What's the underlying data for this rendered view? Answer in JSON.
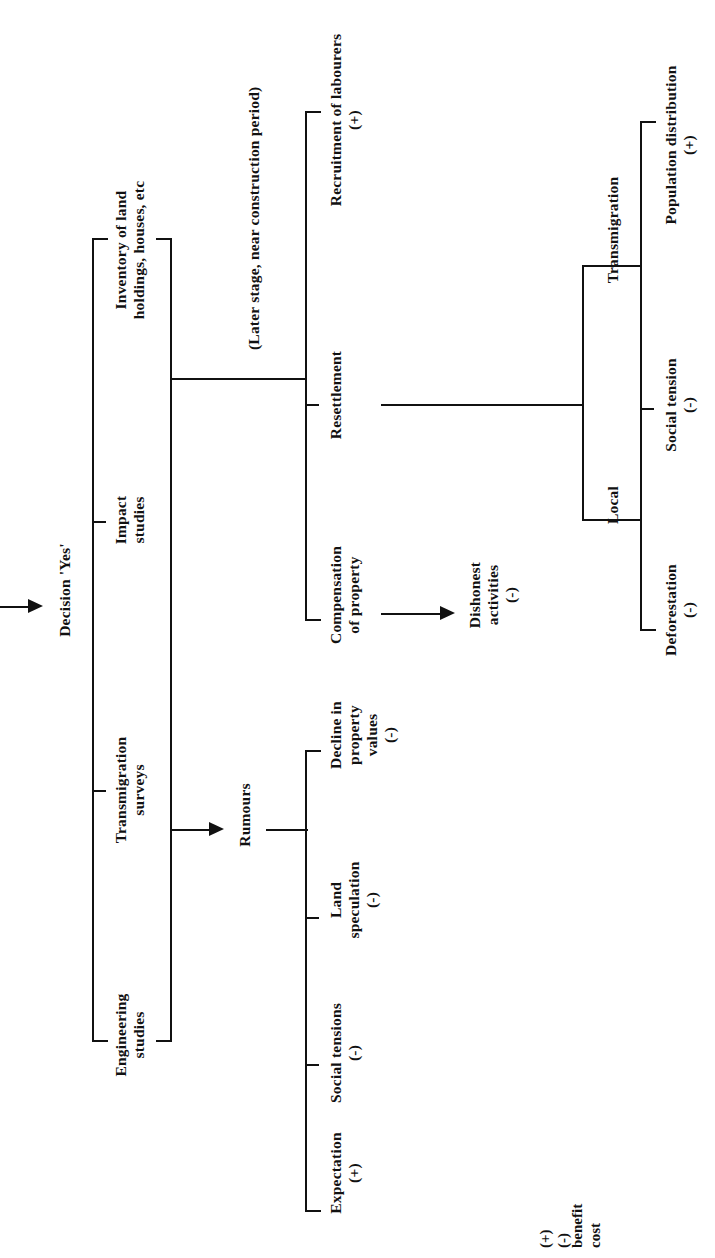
{
  "figure": {
    "orientation": "rotated-90-ccw",
    "ink_color": "#111111",
    "background_color": "#ffffff"
  },
  "root": {
    "label": "Decision 'Yes'",
    "inbound_arrow": true
  },
  "studies": {
    "group_label": "studies-bracket",
    "items": [
      {
        "label": "Inventory of land\nholdings, houses, etc"
      },
      {
        "label": "Impact\nstudies"
      },
      {
        "label": "Transmigration\nsurveys"
      },
      {
        "label": "Engineering\nstudies"
      }
    ]
  },
  "stage_note": {
    "label": "(Later stage, near construction period)"
  },
  "construction_branch": {
    "items": [
      {
        "label": "Recruitment of labourers",
        "sign": "(+)"
      },
      {
        "label": "Resettlement",
        "sign": ""
      },
      {
        "label": "Compensation\nof property",
        "sign": ""
      }
    ]
  },
  "dishonest": {
    "label": "Dishonest\nactivities",
    "sign": "(-)"
  },
  "rumours": {
    "label": "Rumours",
    "items": [
      {
        "label": "Decline in\nproperty\nvalues",
        "sign": "(-)"
      },
      {
        "label": "Land\nspeculation",
        "sign": "(-)"
      },
      {
        "label": "Social tensions",
        "sign": "(-)"
      },
      {
        "label": "Expectation",
        "sign": "(+)"
      }
    ]
  },
  "resettlement_groups": {
    "items": [
      {
        "label": "Transmigration"
      },
      {
        "label": "Local"
      }
    ]
  },
  "outcomes": {
    "items": [
      {
        "label": "Population distribution",
        "sign": "(+)"
      },
      {
        "label": "Social tension",
        "sign": "(-)"
      },
      {
        "label": "Deforestation",
        "sign": "(-)"
      }
    ]
  },
  "legend": {
    "symbols": "(+)\n(-)",
    "meanings": "benefit\ncost"
  }
}
